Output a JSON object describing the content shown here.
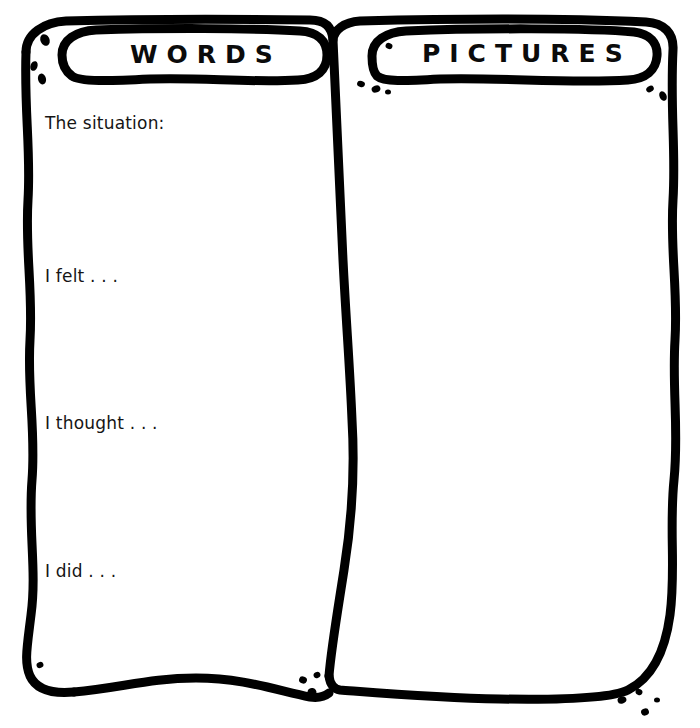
{
  "worksheet": {
    "ink_color": "#000000",
    "background_color": "#ffffff",
    "panels": [
      {
        "id": "words",
        "title": "WORDS"
      },
      {
        "id": "pictures",
        "title": "PICTURES"
      }
    ],
    "prompts": [
      {
        "id": "situation",
        "label": "The situation:"
      },
      {
        "id": "felt",
        "label": "I felt . . ."
      },
      {
        "id": "thought",
        "label": "I thought . . ."
      },
      {
        "id": "did",
        "label": "I did . . ."
      }
    ]
  }
}
